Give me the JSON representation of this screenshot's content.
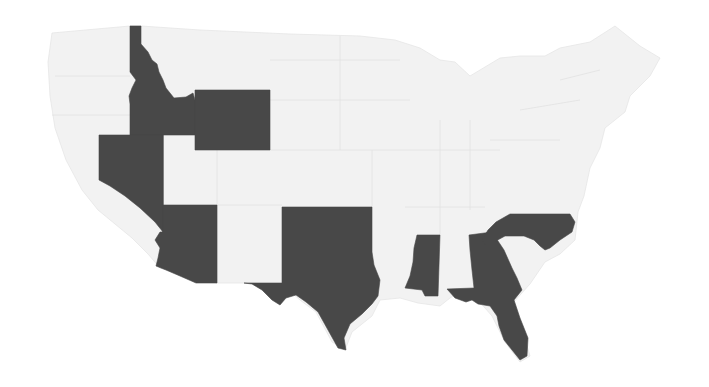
{
  "map": {
    "title": "Contiguous United States — highlighted states",
    "colors": {
      "highlighted": "#484848",
      "other": "#f2f2f2",
      "background": "#ffffff"
    },
    "highlighted_states": [
      "Idaho",
      "Wyoming",
      "Nevada",
      "Arizona",
      "Oklahoma",
      "Texas",
      "Mississippi",
      "Georgia",
      "Florida",
      "North Carolina"
    ],
    "labels": {
      "idaho": "Idaho",
      "wyoming": "Wyoming",
      "nevada": "Nevada",
      "arizona": "Arizona",
      "oklahoma": "Oklahoma",
      "texas": "Texas",
      "mississippi": "Mississippi",
      "georgia": "Georgia",
      "florida": "Florida",
      "north_carolina": "North Carolina"
    }
  }
}
